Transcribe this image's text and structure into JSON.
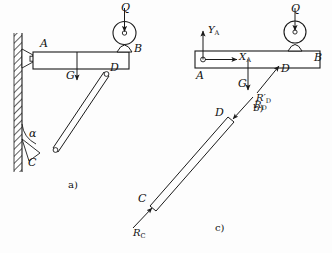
{
  "figure": {
    "stroke_color": "#1a1a1a",
    "fill_color": "#ffffff",
    "background": "#fdfdfd",
    "panels": [
      {
        "id": "a",
        "label": "a)",
        "caption": "Assembly: beam AB hinged to wall at A, strut CD, pulley load Q at B"
      },
      {
        "id": "b",
        "label": "b)",
        "caption": "Free body diagram of beam AB"
      },
      {
        "id": "c",
        "label": "c)",
        "caption": "Free body diagram of two-force strut CD"
      }
    ]
  },
  "panel_a": {
    "panel_label": "a)",
    "points": {
      "A": "A",
      "B": "B",
      "C": "C",
      "D": "D"
    },
    "loads": {
      "Q": "Q",
      "G": "G"
    },
    "angle": "α",
    "icons": {
      "wall": "hatched-wall",
      "pin_a": "pin-support-icon",
      "pin_c": "pin-support-icon",
      "pulley": "pulley-icon",
      "load_arrow": "down-arrow-icon",
      "weight_arrow": "down-arrow-icon"
    }
  },
  "panel_b": {
    "panel_label": "b)",
    "points": {
      "A": "A",
      "B": "B",
      "D": "D"
    },
    "forces": {
      "YA": {
        "base": "Y",
        "sub": "A"
      },
      "XA": {
        "base": "X",
        "sub": "A"
      },
      "G": "G",
      "RD": {
        "base": "R",
        "prime": "′",
        "sub": "D"
      },
      "Q": "Q"
    },
    "icons": {
      "pin_a": "pin-joint-icon",
      "pulley": "pulley-icon",
      "ya_arrow": "up-arrow-icon",
      "xa_arrow": "right-arrow-icon",
      "g_arrow": "down-arrow-icon",
      "rd_arrow": "diagonal-arrow-icon"
    }
  },
  "panel_c": {
    "panel_label": "c)",
    "points": {
      "C": "C",
      "D": "D"
    },
    "forces": {
      "RD": {
        "base": "R",
        "sub": "D"
      },
      "RC": {
        "base": "R",
        "sub": "C"
      }
    },
    "icons": {
      "rd_arrow": "diagonal-arrow-icon",
      "rc_arrow": "diagonal-arrow-icon",
      "strut": "two-force-member"
    }
  }
}
